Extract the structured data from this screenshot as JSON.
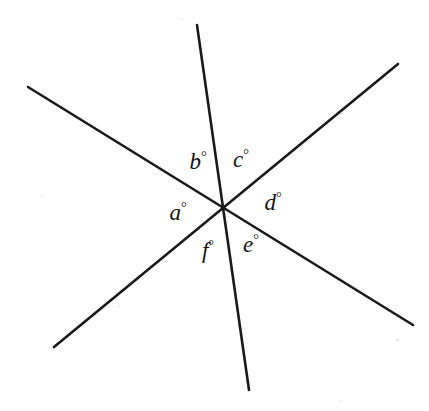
{
  "figure": {
    "background_color": "#ffffff",
    "stroke_color": "#1a1a1a",
    "stroke_width": 2.6,
    "width": 429,
    "height": 411,
    "intersection": {
      "x": 223,
      "y": 208
    },
    "lines": [
      {
        "name": "line-nw-se",
        "x1": 28,
        "y1": 87,
        "x2": 413,
        "y2": 325
      },
      {
        "name": "line-n-s",
        "x1": 197,
        "y1": 25,
        "x2": 249,
        "y2": 390
      },
      {
        "name": "line-sw-ne",
        "x1": 54,
        "y1": 347,
        "x2": 398,
        "y2": 64
      }
    ],
    "labels": [
      {
        "name": "angle-label-a",
        "symbol": "a",
        "degree": "°",
        "x": 178,
        "y": 212
      },
      {
        "name": "angle-label-b",
        "symbol": "b",
        "degree": "°",
        "x": 198,
        "y": 161
      },
      {
        "name": "angle-label-c",
        "symbol": "c",
        "degree": "°",
        "x": 241,
        "y": 159
      },
      {
        "name": "angle-label-d",
        "symbol": "d",
        "degree": "°",
        "x": 273,
        "y": 202
      },
      {
        "name": "angle-label-e",
        "symbol": "e",
        "degree": "°",
        "x": 251,
        "y": 244
      },
      {
        "name": "angle-label-f",
        "symbol": "f",
        "degree": "°",
        "x": 208,
        "y": 250
      }
    ],
    "specks": [
      {
        "x": 396,
        "y": 338,
        "size": 3
      },
      {
        "x": 340,
        "y": 400,
        "size": 2
      },
      {
        "x": 41,
        "y": 195,
        "size": 2
      },
      {
        "x": 118,
        "y": 305,
        "size": 2
      },
      {
        "x": 180,
        "y": 18,
        "size": 2
      }
    ]
  },
  "chart_data": {
    "type": "diagram",
    "angle_labels": [
      "a°",
      "b°",
      "c°",
      "d°",
      "e°",
      "f°"
    ],
    "line_count": 3,
    "angle_count": 6
  }
}
